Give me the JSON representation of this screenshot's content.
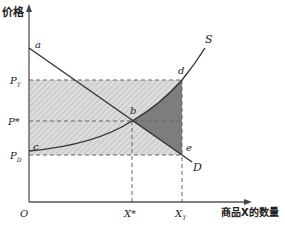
{
  "title": "",
  "axes": {
    "y_label": "价格",
    "x_label": "商品X的数量",
    "origin_label": "O"
  },
  "curves": {
    "supply": {
      "label": "S"
    },
    "demand": {
      "label": "D"
    }
  },
  "points": {
    "a": "a",
    "b": "b",
    "c": "c",
    "d": "d",
    "e": "e"
  },
  "price_labels": {
    "p_t": {
      "main": "P",
      "sub": "T"
    },
    "p_star": {
      "main": "P*"
    },
    "p_d": {
      "main": "P",
      "sub": "D"
    }
  },
  "quantity_labels": {
    "x_star": {
      "main": "X*"
    },
    "x_t": {
      "main": "X",
      "sub": "T"
    }
  },
  "colors": {
    "axis": "#555555",
    "curve": "#333333",
    "hatch_bg": "#d9d9d9",
    "hatch_line": "#bdbdbd",
    "dark_fill": "#7a7a7a",
    "dash": "#666666"
  }
}
